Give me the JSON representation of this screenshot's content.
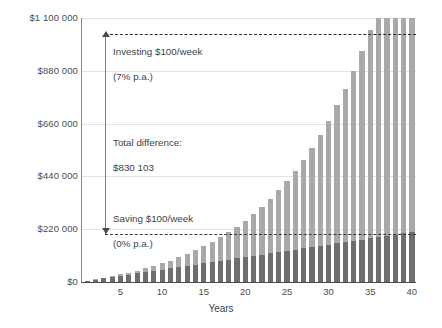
{
  "chart_data": {
    "type": "bar",
    "stacked": true,
    "title": "",
    "xlabel": "Years",
    "ylabel": "",
    "ylim": [
      0,
      1100000
    ],
    "grid": true,
    "legend_position": "none",
    "x": [
      1,
      2,
      3,
      4,
      5,
      6,
      7,
      8,
      9,
      10,
      11,
      12,
      13,
      14,
      15,
      16,
      17,
      18,
      19,
      20,
      21,
      22,
      23,
      24,
      25,
      26,
      27,
      28,
      29,
      30,
      31,
      32,
      33,
      34,
      35,
      36,
      37,
      38,
      39,
      40
    ],
    "y_ticks": [
      0,
      220000,
      440000,
      660000,
      880000,
      1100000
    ],
    "y_tick_labels": [
      "$0",
      "$220 000",
      "$440 000",
      "$660 000",
      "$880 000",
      "$1 100 000"
    ],
    "x_ticks": [
      5,
      10,
      15,
      20,
      25,
      30,
      35,
      40
    ],
    "x_tick_labels": [
      "5",
      "10",
      "15",
      "20",
      "25",
      "30",
      "35",
      "40"
    ],
    "series": [
      {
        "name": "Saving $100/week (0% p.a.)",
        "color": "#6e6e6e",
        "values": [
          5200,
          10400,
          15600,
          20800,
          26000,
          31200,
          36400,
          41600,
          46800,
          52000,
          57200,
          62400,
          67600,
          72800,
          78000,
          83200,
          88400,
          93600,
          98800,
          104000,
          109200,
          114400,
          119600,
          124800,
          130000,
          135200,
          140400,
          145600,
          150800,
          156000,
          161200,
          166400,
          171600,
          176800,
          182000,
          187200,
          192400,
          197600,
          202800,
          208000
        ]
      },
      {
        "name": "Investing $100/week (7% p.a.) — growth above savings",
        "color": "#a9a9a9",
        "values": [
          188,
          777,
          1806,
          3320,
          5370,
          8010,
          11300,
          15305,
          20095,
          25747,
          32345,
          39979,
          48748,
          58757,
          70121,
          82964,
          97418,
          113628,
          131747,
          151944,
          174397,
          199301,
          226864,
          257313,
          290890,
          327858,
          368500,
          413124,
          462061,
          515670,
          574339,
          638488,
          708571,
          785079,
          868543,
          959537,
          1058680,
          1166639,
          1284135,
          1411948
        ]
      }
    ],
    "total_at_year_40_investing": 1038103,
    "total_at_year_40_saving": 208000
  },
  "annotations": {
    "top": {
      "line1": "Investing $100/week",
      "line2": "(7% p.a.)"
    },
    "middle": {
      "line1": "Total difference:",
      "line2": "$830 103"
    },
    "bottom": {
      "line1": "Saving $100/week",
      "line2": "(0% p.a.)"
    }
  },
  "colors": {
    "saving_bar": "#6e6e6e",
    "investing_bar": "#a9a9a9",
    "gridline": "#e3e3e3",
    "axis": "#4a4a4a",
    "text": "#4d4d4d",
    "dashed_line": "#2b2b2b"
  }
}
